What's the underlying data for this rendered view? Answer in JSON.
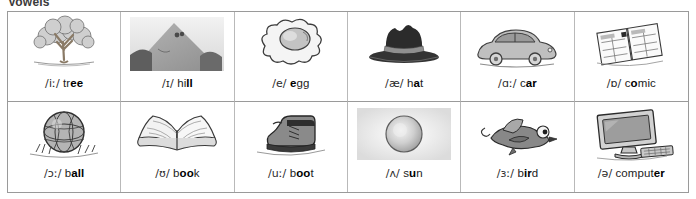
{
  "title": "Vowels",
  "table": {
    "columns": 6,
    "rows": 2,
    "border_color": "#9a9a9a",
    "divider_color": "#b9b9b9",
    "background": "#ffffff",
    "text_color": "#1c1c1c"
  },
  "cells": [
    {
      "ipa": "/iː/",
      "word": "tree",
      "word_prefix": "tr",
      "word_highlight": "ee",
      "word_suffix": "",
      "caption": "/iː/ tree",
      "icon": "tree-icon",
      "illustration": "pencil sketch of a broad leafy tree on a patch of ground"
    },
    {
      "ipa": "/ɪ/",
      "word": "hill",
      "word_prefix": "hi",
      "word_highlight": "ll",
      "word_suffix": "",
      "caption": "/ɪ/ hill",
      "icon": "hill-icon",
      "illustration": "grayscale photo of a steep grassy hill with a peak"
    },
    {
      "ipa": "/e/",
      "word": "egg",
      "word_prefix": "",
      "word_highlight": "e",
      "word_suffix": "gg",
      "caption": "/e/ egg",
      "icon": "egg-icon",
      "illustration": "line drawing of a fried egg with yolk and white"
    },
    {
      "ipa": "/æ/",
      "word": "hat",
      "word_prefix": "h",
      "word_highlight": "a",
      "word_suffix": "t",
      "caption": "/æ/ hat",
      "icon": "hat-icon",
      "illustration": "dark fedora hat with a band, wide brim"
    },
    {
      "ipa": "/ɑː/",
      "word": "car",
      "word_prefix": "c",
      "word_highlight": "ar",
      "word_suffix": "",
      "caption": "/ɑː/ car",
      "icon": "car-icon",
      "illustration": "cartoon sketch of a rounded grey car in profile"
    },
    {
      "ipa": "/ɒ/",
      "word": "comic",
      "word_prefix": "c",
      "word_highlight": "o",
      "word_suffix": "mic",
      "caption": "/ɒ/ comic",
      "icon": "comic-icon",
      "illustration": "line drawing of an open comic book with panel grid"
    },
    {
      "ipa": "/ɔː/",
      "word": "ball",
      "word_prefix": "b",
      "word_highlight": "all",
      "word_suffix": "",
      "caption": "/ɔː/ ball",
      "icon": "ball-icon",
      "illustration": "sketch of a segmented ball resting on grass"
    },
    {
      "ipa": "/ʊ/",
      "word": "book",
      "word_prefix": "b",
      "word_highlight": "oo",
      "word_suffix": "k",
      "caption": "/ʊ/ book",
      "icon": "book-icon",
      "illustration": "sketch of an open book with facing pages"
    },
    {
      "ipa": "/uː/",
      "word": "boot",
      "word_prefix": "b",
      "word_highlight": "oo",
      "word_suffix": "t",
      "caption": "/uː/ boot",
      "icon": "boot-icon",
      "illustration": "sketch of a laced leather work boot"
    },
    {
      "ipa": "/ʌ/",
      "word": "sun",
      "word_prefix": "s",
      "word_highlight": "u",
      "word_suffix": "n",
      "caption": "/ʌ/ sun",
      "icon": "sun-icon",
      "illustration": "grayscale photo of a glowing round sun disc"
    },
    {
      "ipa": "/ɜː/",
      "word": "bird",
      "word_prefix": "b",
      "word_highlight": "ir",
      "word_suffix": "d",
      "caption": "/ɜː/ bird",
      "icon": "bird-icon",
      "illustration": "cartoon bird in flight with big eyes"
    },
    {
      "ipa": "/ə/",
      "word": "computer",
      "word_prefix": "comput",
      "word_highlight": "er",
      "word_suffix": "",
      "caption": "/ə/ computer",
      "icon": "computer-icon",
      "illustration": "sketch of a desktop monitor with keyboard"
    }
  ]
}
